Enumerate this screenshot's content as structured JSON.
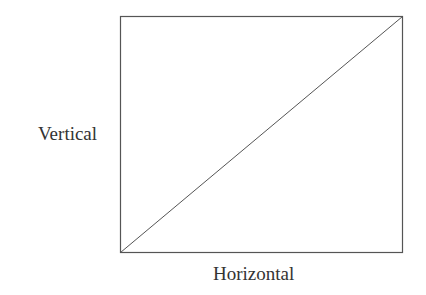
{
  "diagram": {
    "labels": {
      "vertical": "Vertical",
      "horizontal": "Horizontal"
    },
    "rectangle": {
      "x": 120,
      "y": 16.5,
      "width": 282,
      "height": 236,
      "stroke": "#555555"
    },
    "diagonal": {
      "from": "bottom-left",
      "to": "top-right",
      "stroke": "#555555"
    }
  }
}
